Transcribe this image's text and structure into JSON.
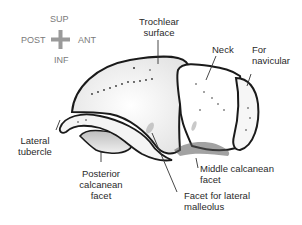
{
  "orientation": {
    "superior": "SUP",
    "inferior": "INF",
    "posterior": "POST",
    "anterior": "ANT",
    "cross_color": "#9a9a9a"
  },
  "labels": {
    "trochlear_surface": "Trochlear\nsurface",
    "neck": "Neck",
    "for_navicular": "For\nnavicular",
    "lateral_tubercle": "Lateral\ntubercle",
    "posterior_calcanean_facet": "Posterior\ncalcanean\nfacet",
    "middle_calcanean_facet": "Middle calcanean\nfacet",
    "facet_lateral_malleolus": "Facet for lateral\nmalleolus"
  },
  "colors": {
    "outline": "#1a1a1a",
    "text": "#2a2a2a",
    "orientation_text": "#7a7a7a",
    "shade": "#cfcfcf"
  }
}
